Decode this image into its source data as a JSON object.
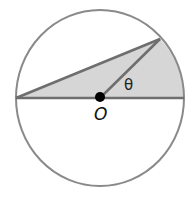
{
  "diagram": {
    "center_label": "O",
    "angle_label": "θ",
    "colors": {
      "stroke": "#7a7a7a",
      "fill": "#d6d6d6",
      "center_dot": "#000000",
      "background": "#ffffff"
    },
    "shapes": [
      "circle",
      "diameter",
      "radius-to-point-on-circle",
      "chord-from-left-endpoint",
      "shaded-triangle-and-sector"
    ]
  }
}
